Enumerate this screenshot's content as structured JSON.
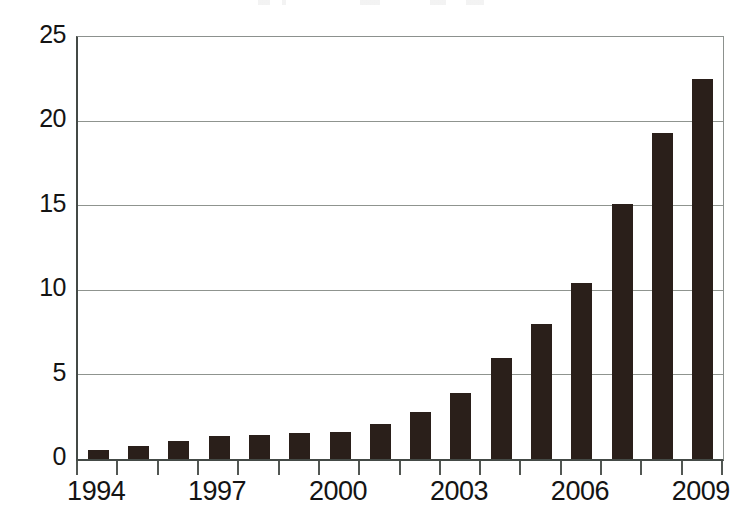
{
  "chart_data": {
    "type": "bar",
    "title": "",
    "subtitle": "",
    "xlabel": "",
    "ylabel": "",
    "categories": [
      "1994",
      "1995",
      "1996",
      "1997",
      "1998",
      "1999",
      "2000",
      "2001",
      "2002",
      "2003",
      "2004",
      "2005",
      "2006",
      "2007",
      "2008",
      "2009"
    ],
    "values": [
      0.55,
      0.75,
      1.05,
      1.35,
      1.4,
      1.55,
      1.6,
      2.05,
      2.8,
      3.9,
      6.0,
      8.0,
      10.45,
      15.1,
      19.3,
      22.5
    ],
    "series": [
      {
        "name": "",
        "values": [
          0.55,
          0.75,
          1.05,
          1.35,
          1.4,
          1.55,
          1.6,
          2.05,
          2.8,
          3.9,
          6.0,
          8.0,
          10.45,
          15.1,
          19.3,
          22.5
        ]
      }
    ],
    "ylim": [
      0,
      25
    ],
    "y_ticks": [
      0,
      5,
      10,
      15,
      20,
      25
    ],
    "y_tick_labels": [
      "0",
      "5",
      "10",
      "15",
      "20",
      "25"
    ],
    "x_tick_labels_shown": [
      "1994",
      "1997",
      "2000",
      "2003",
      "2006",
      "2009"
    ],
    "x_tick_label_indices": [
      0,
      3,
      6,
      9,
      12,
      15
    ],
    "grid": true,
    "grid_axis": "y",
    "legend": false,
    "legend_position": "none",
    "bar_color": "#2a1f1a",
    "grid_color": "#8f948f",
    "axis_color": "#444a46",
    "background_color": "#ffffff",
    "bar_count": 16
  }
}
